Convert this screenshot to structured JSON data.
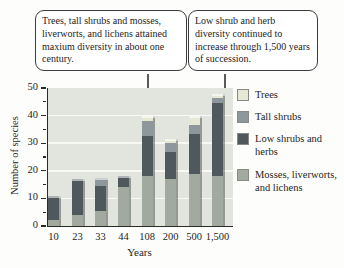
{
  "figure": {
    "callout_left": "Trees, tall shrubs and mosses, liverworts, and lichens attained maxium diversity in about one century.",
    "callout_right": "Low shrub and herb diversity continued to increase through 1,500 years of succession."
  },
  "chart_data": {
    "type": "bar",
    "stacked": true,
    "title": "",
    "xlabel": "Years",
    "ylabel": "Number of species",
    "ylim": [
      0,
      50
    ],
    "ytick_major_step": 10,
    "ytick_minor_step": 5,
    "grid": true,
    "legend_position": "right",
    "plot_background": "#e2e5dd",
    "categories": [
      "10",
      "23",
      "33",
      "44",
      "108",
      "200",
      "500",
      "1,500"
    ],
    "series": [
      {
        "name": "Mosses, liverworts, and lichens",
        "color": "#a2a99e",
        "values": [
          2,
          4,
          5.5,
          14,
          18,
          17,
          19,
          18
        ]
      },
      {
        "name": "Low shrubs and herbs",
        "color": "#4f585c",
        "values": [
          9,
          13,
          9,
          4,
          14.5,
          10,
          14.5,
          26.5
        ]
      },
      {
        "name": "Tall shrubs",
        "color": "#8e979b",
        "values": [
          0,
          0,
          3,
          0,
          5.5,
          3,
          3,
          2
        ]
      },
      {
        "name": "Trees",
        "color": "#e7e8d3",
        "values": [
          0,
          0,
          0,
          0,
          2,
          1.5,
          3.5,
          1.5
        ]
      }
    ],
    "totals": [
      11,
      17,
      17.5,
      18,
      40,
      31.5,
      40,
      48
    ],
    "legend_order": [
      "Trees",
      "Tall shrubs",
      "Low shrubs and herbs",
      "Mosses, liverworts, and lichens"
    ]
  }
}
